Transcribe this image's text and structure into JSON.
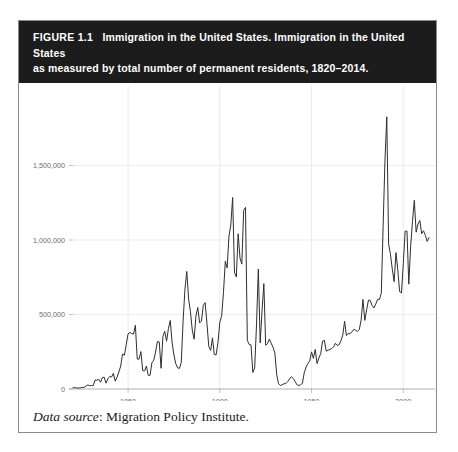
{
  "figure": {
    "label": "FIGURE 1.1",
    "title_line1": "Immigration in the United States. Immigration in the United States",
    "title_line2": "as measured by total number of permanent residents, 1820–2014.",
    "caption_italic": "Data source",
    "caption_rest": ": Migration Policy Institute."
  },
  "colors": {
    "header_background": "#1c1c1c",
    "header_text": "#ffffff",
    "panel_border": "#8a8a8a",
    "series_line": "#2e2e2e",
    "gridline": "#e4e4e8",
    "axis": "#8f8f8f",
    "tick_text": "#6d6d6d"
  },
  "chart_data": {
    "type": "line",
    "title": "Immigration in the United States as measured by total number of permanent residents, 1820–2014",
    "xlabel": "",
    "ylabel": "",
    "xlim": [
      1820,
      2014
    ],
    "ylim": [
      0,
      1900000
    ],
    "grid": true,
    "legend": null,
    "xticks": [
      1850,
      1900,
      1950,
      2000
    ],
    "xticklabels": [
      "1850",
      "1900",
      "1950",
      "2000"
    ],
    "yticks": [
      0,
      500000,
      1000000,
      1500000
    ],
    "yticklabels": [
      "0",
      "500,000",
      "1,000,000",
      "1,500,000"
    ],
    "series": [
      {
        "name": "Permanent residents",
        "x": [
          1820,
          1821,
          1822,
          1823,
          1824,
          1825,
          1826,
          1827,
          1828,
          1829,
          1830,
          1831,
          1832,
          1833,
          1834,
          1835,
          1836,
          1837,
          1838,
          1839,
          1840,
          1841,
          1842,
          1843,
          1844,
          1845,
          1846,
          1847,
          1848,
          1849,
          1850,
          1851,
          1852,
          1853,
          1854,
          1855,
          1856,
          1857,
          1858,
          1859,
          1860,
          1861,
          1862,
          1863,
          1864,
          1865,
          1866,
          1867,
          1868,
          1869,
          1870,
          1871,
          1872,
          1873,
          1874,
          1875,
          1876,
          1877,
          1878,
          1879,
          1880,
          1881,
          1882,
          1883,
          1884,
          1885,
          1886,
          1887,
          1888,
          1889,
          1890,
          1891,
          1892,
          1893,
          1894,
          1895,
          1896,
          1897,
          1898,
          1899,
          1900,
          1901,
          1902,
          1903,
          1904,
          1905,
          1906,
          1907,
          1908,
          1909,
          1910,
          1911,
          1912,
          1913,
          1914,
          1915,
          1916,
          1917,
          1918,
          1919,
          1920,
          1921,
          1922,
          1923,
          1924,
          1925,
          1926,
          1927,
          1928,
          1929,
          1930,
          1931,
          1932,
          1933,
          1934,
          1935,
          1936,
          1937,
          1938,
          1939,
          1940,
          1941,
          1942,
          1943,
          1944,
          1945,
          1946,
          1947,
          1948,
          1949,
          1950,
          1951,
          1952,
          1953,
          1954,
          1955,
          1956,
          1957,
          1958,
          1959,
          1960,
          1961,
          1962,
          1963,
          1964,
          1965,
          1966,
          1967,
          1968,
          1969,
          1970,
          1971,
          1972,
          1973,
          1974,
          1975,
          1976,
          1977,
          1978,
          1979,
          1980,
          1981,
          1982,
          1983,
          1984,
          1985,
          1986,
          1987,
          1988,
          1989,
          1990,
          1991,
          1992,
          1993,
          1994,
          1995,
          1996,
          1997,
          1998,
          1999,
          2000,
          2001,
          2002,
          2003,
          2004,
          2005,
          2006,
          2007,
          2008,
          2009,
          2010,
          2011,
          2012,
          2013,
          2014
        ],
        "values": [
          8385,
          9127,
          6911,
          6354,
          7912,
          10199,
          10837,
          18875,
          27382,
          22520,
          23322,
          22633,
          60482,
          58640,
          65365,
          45374,
          76242,
          79340,
          38914,
          68069,
          84066,
          80289,
          104565,
          52496,
          78615,
          114371,
          154416,
          234968,
          226527,
          297024,
          369980,
          379466,
          371603,
          368645,
          427833,
          200877,
          200436,
          251306,
          123126,
          121282,
          153640,
          91918,
          91985,
          176282,
          193418,
          248120,
          318568,
          315722,
          138840,
          352768,
          387203,
          321350,
          404806,
          459803,
          313339,
          227498,
          169986,
          141857,
          138469,
          177826,
          457257,
          669431,
          788992,
          603322,
          518592,
          395346,
          334203,
          490109,
          546889,
          444427,
          455302,
          560319,
          579663,
          439730,
          285631,
          258536,
          343267,
          230832,
          229299,
          311715,
          448572,
          487918,
          648743,
          857046,
          812870,
          1026499,
          1100735,
          1285349,
          782870,
          751786,
          1041570,
          878587,
          838172,
          1197892,
          1218480,
          326700,
          298826,
          295403,
          110618,
          141132,
          430001,
          805228,
          309556,
          522919,
          706896,
          294314,
          304488,
          335175,
          307255,
          279678,
          241700,
          97139,
          35576,
          23068,
          29470,
          34956,
          36329,
          50244,
          67895,
          82998,
          70756,
          51776,
          28781,
          23725,
          28551,
          38119,
          108721,
          147292,
          170570,
          188317,
          249187,
          205717,
          265520,
          170434,
          208177,
          237790,
          321625,
          326867,
          253265,
          260686,
          265398,
          271344,
          283763,
          306260,
          292248,
          296697,
          323040,
          361972,
          454448,
          358579,
          373326,
          370478,
          384685,
          400063,
          394861,
          386194,
          398613,
          462315,
          601442,
          460348,
          530639,
          596600,
          594131,
          559763,
          543903,
          570009,
          601708,
          601516,
          643025,
          1090924,
          1535872,
          1826595,
          973445,
          903916,
          803993,
          720177,
          915560,
          797847,
          653206,
          644787,
          841002,
          1058902,
          1059356,
          703542,
          957883,
          1122257,
          1266129,
          1052415,
          1107126,
          1130818,
          1042625,
          1062040,
          1031631,
          990553,
          1016518
        ]
      }
    ],
    "annotations": [
      {
        "text": "Peak 1907",
        "value": 1285349
      },
      {
        "text": "Peak 1991 (IRCA legalizations)",
        "value": 1826595
      },
      {
        "text": "Depression/WWII trough 1933",
        "value": 23068
      }
    ]
  }
}
